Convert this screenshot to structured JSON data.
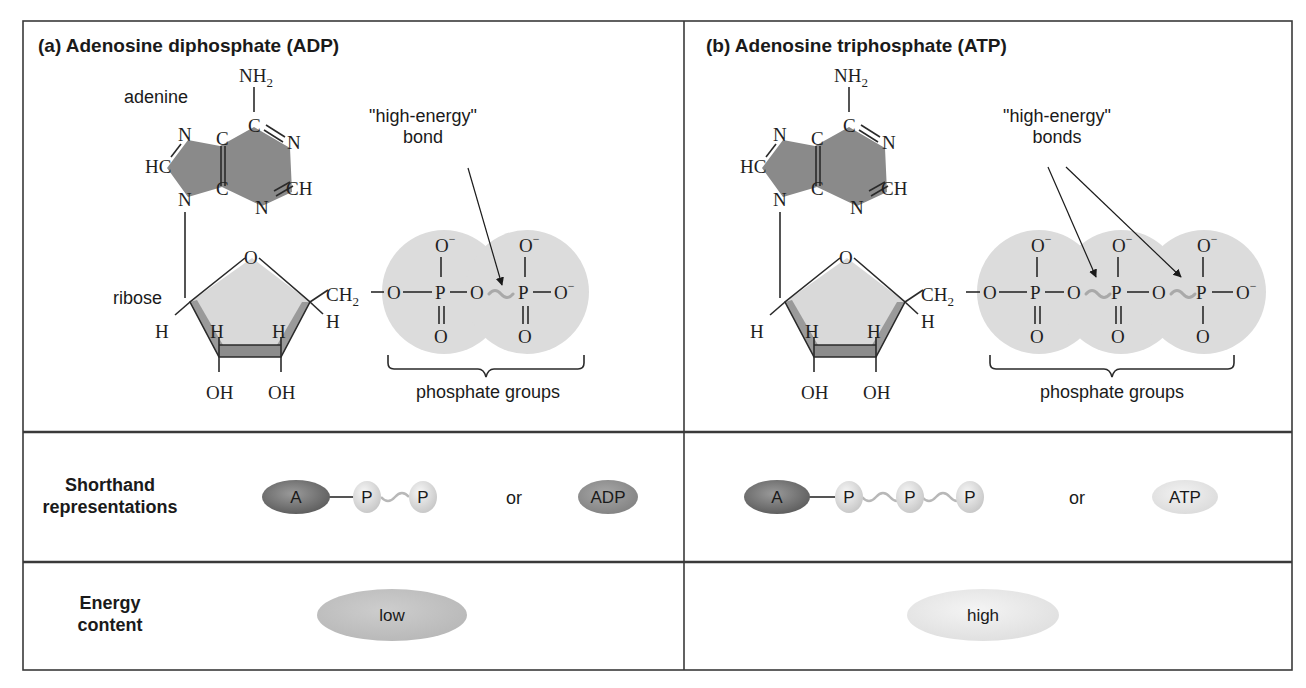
{
  "panels": {
    "adp": {
      "title": "(a) Adenosine diphosphate (ADP)",
      "adenine_label": "adenine",
      "ribose_label": "ribose",
      "annotation_line1": "\"high-energy\"",
      "annotation_line2": "bond",
      "phosphate_label": "phosphate groups",
      "phosphate_count": 2
    },
    "atp": {
      "title": "(b) Adenosine triphosphate (ATP)",
      "annotation_line1": "\"high-energy\"",
      "annotation_line2": "bonds",
      "phosphate_label": "phosphate groups",
      "phosphate_count": 3
    }
  },
  "atoms": {
    "nh": "NH",
    "sub2": "2",
    "c": "C",
    "n": "N",
    "hc": "HC",
    "ch": "CH",
    "o": "O",
    "h": "H",
    "oh": "OH",
    "ch2": "CH",
    "p": "P",
    "minus": "−"
  },
  "rows": {
    "shorthand": {
      "label_line1": "Shorthand",
      "label_line2": "representations",
      "adenosine": "A",
      "phosphate": "P",
      "or": "or",
      "adp_abbrev": "ADP",
      "atp_abbrev": "ATP"
    },
    "energy": {
      "label_line1": "Energy",
      "label_line2": "content",
      "adp_value": "low",
      "atp_value": "high"
    }
  },
  "colors": {
    "adenine_fill": "#8a8a8a",
    "ribose_fill": "#d9d9d9",
    "ribose_edge": "#9a9a9a",
    "phosphate_fill": "#dcdcdc",
    "adenosine_oval": "#7d7d7d",
    "phosphate_ball": "#e4e4e4",
    "adp_oval": "#9a9a9a",
    "atp_oval": "#e6e6e6",
    "low_oval": "#c4c4c4",
    "high_oval": "#eaeaea"
  }
}
